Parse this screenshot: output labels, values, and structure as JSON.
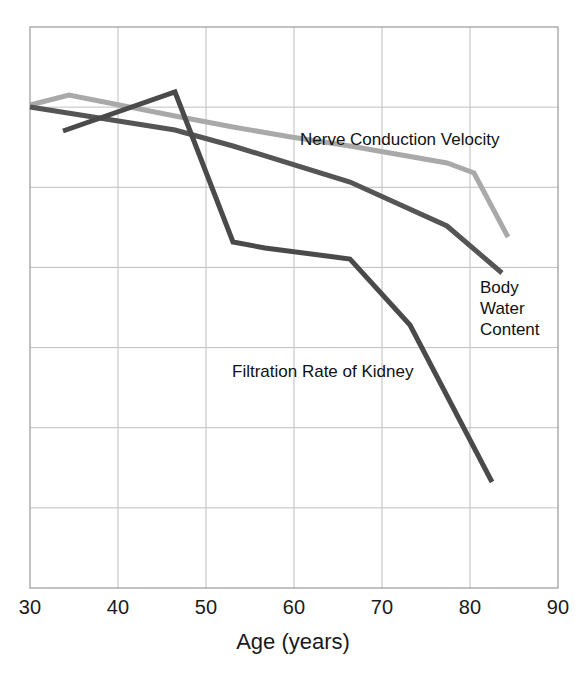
{
  "chart_data": {
    "type": "line",
    "title": "",
    "xlabel": "Age (years)",
    "ylabel": "",
    "xlim": [
      30,
      90
    ],
    "ylim": [
      0,
      100
    ],
    "xticks": [
      "30",
      "40",
      "50",
      "60",
      "70",
      "80",
      "90"
    ],
    "yticks": [],
    "grid": true,
    "legend_position": "inline-annotations",
    "series": [
      {
        "name": "Nerve Conduction Velocity",
        "color": "#a9a9a9",
        "label_text": "Nerve Conduction Velocity",
        "x": [
          29.5,
          34.5,
          46.5,
          53.0,
          60.0,
          66.0,
          77.0,
          80.0,
          84.5
        ],
        "y": [
          86.0,
          88.0,
          83.5,
          80.5,
          77.5,
          75.0,
          71.0,
          68.5,
          62.5
        ],
        "points_px": [
          [
            30,
            105
          ],
          [
            69,
            95
          ],
          [
            175,
            116
          ],
          [
            233,
            127
          ],
          [
            291,
            137
          ],
          [
            350,
            146
          ],
          [
            447,
            163
          ],
          [
            474,
            173
          ],
          [
            508,
            237
          ]
        ]
      },
      {
        "name": "Body Water Content",
        "color": "#555555",
        "label_text": "Body\nWater\nContent",
        "x": [
          29.5,
          46.5,
          53.0,
          66.0,
          77.0,
          83.5
        ],
        "y": [
          86.5,
          80.0,
          77.0,
          71.0,
          64.5,
          60.0
        ],
        "points_px": [
          [
            30,
            107
          ],
          [
            175,
            130
          ],
          [
            233,
            146
          ],
          [
            350,
            182
          ],
          [
            447,
            226
          ],
          [
            502,
            273
          ]
        ]
      },
      {
        "name": "Filtration Rate of Kidney",
        "color": "#4a4a4a",
        "label_text": "Filtration Rate of Kidney",
        "x": [
          37.0,
          46.5,
          53.0,
          56.5,
          65.5,
          73.5,
          82.5
        ],
        "y": [
          83.0,
          89.0,
          62.5,
          61.5,
          59.0,
          48.0,
          26.0
        ],
        "points_px": [
          [
            63,
            131
          ],
          [
            175,
            92
          ],
          [
            233,
            242
          ],
          [
            265,
            248
          ],
          [
            350,
            259
          ],
          [
            410,
            325
          ],
          [
            492,
            482
          ]
        ]
      }
    ]
  },
  "axis": {
    "x_title": "Age (years)",
    "x_ticks": [
      {
        "label": "30",
        "px": 30
      },
      {
        "label": "40",
        "px": 118
      },
      {
        "label": "50",
        "px": 206
      },
      {
        "label": "60",
        "px": 294
      },
      {
        "label": "70",
        "px": 382
      },
      {
        "label": "80",
        "px": 470
      },
      {
        "label": "90",
        "px": 558
      }
    ]
  },
  "plot_area": {
    "left": 30,
    "right": 558,
    "top": 27,
    "bottom": 588,
    "grid_color": "#bfbfbf",
    "border_color": "#9a9a9a",
    "background": "#ffffff"
  },
  "labels": {
    "nerve": "Nerve Conduction Velocity",
    "body_line1": "Body",
    "body_line2": "Water",
    "body_line3": "Content",
    "filtration": "Filtration Rate of Kidney"
  }
}
